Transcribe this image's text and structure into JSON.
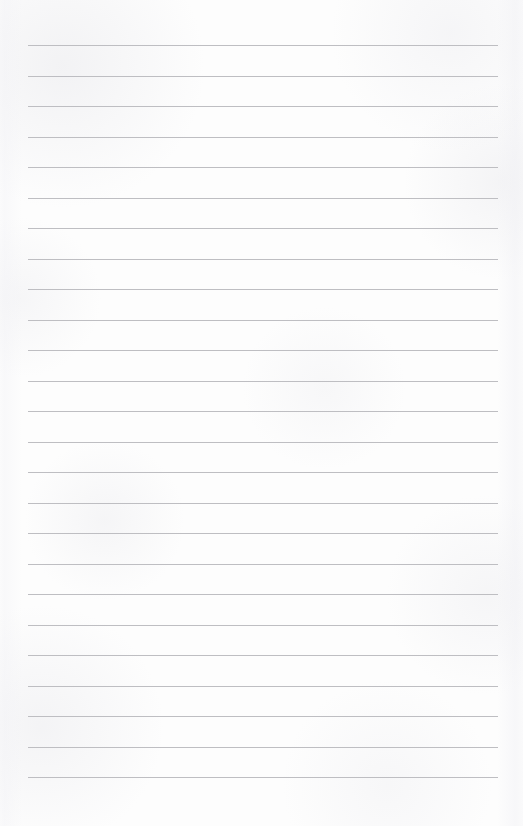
{
  "page": {
    "kind": "lined-paper-sheet",
    "width": 523,
    "height": 826,
    "background_color": "#fdfdfd",
    "content_text": "",
    "is_blank": true
  },
  "ruling": {
    "line_color": "#b9b9bd",
    "line_thickness": 1,
    "line_count": 25,
    "line_left": 28,
    "line_right": 498,
    "line_width": 470,
    "first_line_y": 45,
    "line_spacing": 30.55,
    "top_margin": 45,
    "bottom_margin": 48,
    "left_margin": 28,
    "right_margin": 25,
    "lines": [
      {
        "index": 1,
        "y": 45,
        "x1": 28,
        "x2": 498
      },
      {
        "index": 2,
        "y": 76,
        "x1": 28,
        "x2": 498
      },
      {
        "index": 3,
        "y": 106,
        "x1": 28,
        "x2": 498
      },
      {
        "index": 4,
        "y": 137,
        "x1": 28,
        "x2": 498
      },
      {
        "index": 5,
        "y": 167,
        "x1": 28,
        "x2": 498
      },
      {
        "index": 6,
        "y": 198,
        "x1": 28,
        "x2": 498
      },
      {
        "index": 7,
        "y": 228,
        "x1": 28,
        "x2": 498
      },
      {
        "index": 8,
        "y": 259,
        "x1": 28,
        "x2": 498
      },
      {
        "index": 9,
        "y": 289,
        "x1": 28,
        "x2": 498
      },
      {
        "index": 10,
        "y": 320,
        "x1": 28,
        "x2": 498
      },
      {
        "index": 11,
        "y": 350,
        "x1": 28,
        "x2": 498
      },
      {
        "index": 12,
        "y": 381,
        "x1": 28,
        "x2": 498
      },
      {
        "index": 13,
        "y": 411,
        "x1": 28,
        "x2": 498
      },
      {
        "index": 14,
        "y": 442,
        "x1": 28,
        "x2": 498
      },
      {
        "index": 15,
        "y": 472,
        "x1": 28,
        "x2": 498
      },
      {
        "index": 16,
        "y": 503,
        "x1": 28,
        "x2": 498
      },
      {
        "index": 17,
        "y": 533,
        "x1": 28,
        "x2": 498
      },
      {
        "index": 18,
        "y": 564,
        "x1": 28,
        "x2": 498
      },
      {
        "index": 19,
        "y": 594,
        "x1": 28,
        "x2": 498
      },
      {
        "index": 20,
        "y": 625,
        "x1": 28,
        "x2": 498
      },
      {
        "index": 21,
        "y": 655,
        "x1": 28,
        "x2": 498
      },
      {
        "index": 22,
        "y": 686,
        "x1": 28,
        "x2": 498
      },
      {
        "index": 23,
        "y": 716,
        "x1": 28,
        "x2": 498
      },
      {
        "index": 24,
        "y": 747,
        "x1": 28,
        "x2": 498
      },
      {
        "index": 25,
        "y": 777,
        "x1": 28,
        "x2": 498
      }
    ]
  }
}
